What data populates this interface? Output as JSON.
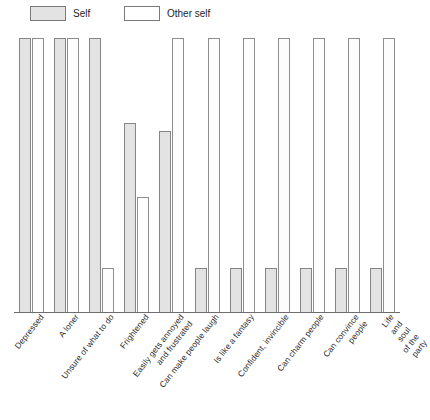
{
  "legend": {
    "items": [
      {
        "label": "Self",
        "key": "self",
        "color": "#e3e3e3"
      },
      {
        "label": "Other self",
        "key": "other",
        "color": "#ffffff"
      }
    ]
  },
  "chart_data": {
    "type": "bar",
    "title": "",
    "xlabel": "",
    "ylabel": "",
    "ylim": [
      0,
      100
    ],
    "grid": false,
    "legend_position": "top-left",
    "categories": [
      "Depressed",
      "A loner",
      "Unsure of what to do",
      "Frightened",
      "Easily gets annoyed\nand frustrated",
      "Can make people laugh",
      "Is like a fantasy",
      "Confident, invincible",
      "Can charm people",
      "Can convince people",
      "Life and soul of the party"
    ],
    "series": [
      {
        "name": "Self",
        "color": "#e3e3e3",
        "values": [
          100,
          100,
          100,
          69,
          66,
          16,
          16,
          16,
          16,
          16,
          16
        ]
      },
      {
        "name": "Other self",
        "color": "#ffffff",
        "values": [
          100,
          100,
          16,
          42,
          100,
          100,
          100,
          100,
          100,
          100,
          100
        ]
      }
    ]
  }
}
